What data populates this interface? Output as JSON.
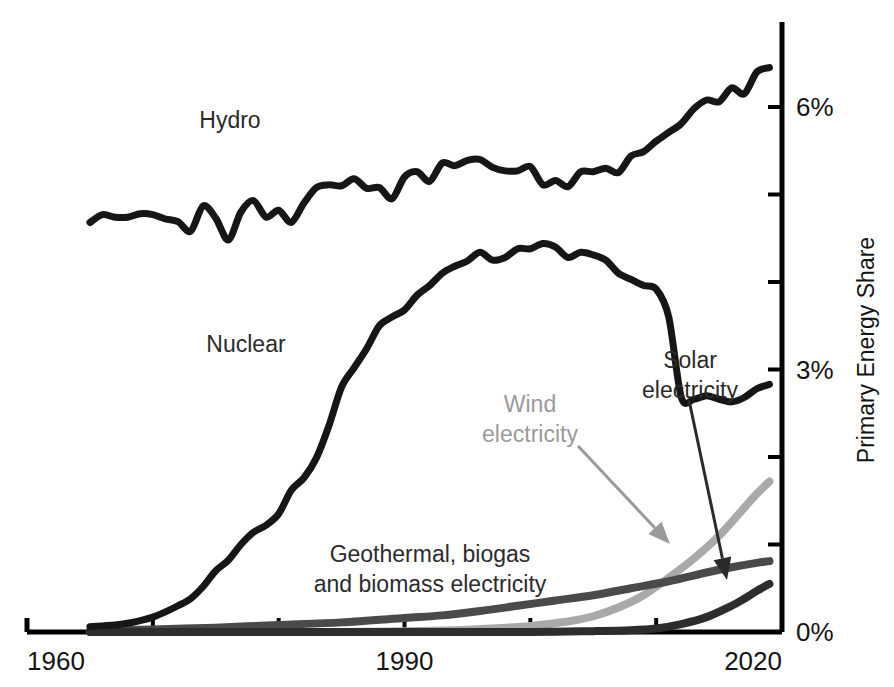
{
  "chart_data": {
    "type": "line",
    "title": "",
    "subtitle": "",
    "xlabel": "",
    "ylabel": "Primary Energy Share",
    "xlim": [
      1960,
      2020
    ],
    "ylim": [
      0,
      7
    ],
    "grid": false,
    "legend_position": "inline-annotations",
    "x_ticks": [
      {
        "value": 1960,
        "label": "1960"
      },
      {
        "value": 1970,
        "label": ""
      },
      {
        "value": 1980,
        "label": ""
      },
      {
        "value": 1990,
        "label": "1990"
      },
      {
        "value": 2000,
        "label": ""
      },
      {
        "value": 2010,
        "label": ""
      },
      {
        "value": 2020,
        "label": "2020"
      }
    ],
    "y_ticks": [
      {
        "value": 0,
        "label": "0%"
      },
      {
        "value": 1,
        "label": ""
      },
      {
        "value": 2,
        "label": ""
      },
      {
        "value": 3,
        "label": "3%"
      },
      {
        "value": 4,
        "label": ""
      },
      {
        "value": 5,
        "label": ""
      },
      {
        "value": 6,
        "label": "6%"
      }
    ],
    "colors": {
      "hydro": "#161616",
      "nuclear": "#161616",
      "wind": "#a9a9a9",
      "solar": "#2d2d2d",
      "geothermal": "#4a4a4a",
      "axis": "#000000",
      "text": "#141414",
      "wind_label": "#9a9a9a"
    },
    "series": [
      {
        "name": "Hydro",
        "color": "#161616",
        "width": 7,
        "x": [
          1965,
          1966,
          1967,
          1968,
          1969,
          1970,
          1971,
          1972,
          1973,
          1974,
          1975,
          1976,
          1977,
          1978,
          1979,
          1980,
          1981,
          1982,
          1983,
          1984,
          1985,
          1986,
          1987,
          1988,
          1989,
          1990,
          1991,
          1992,
          1993,
          1994,
          1995,
          1996,
          1997,
          1998,
          1999,
          2000,
          2001,
          2002,
          2003,
          2004,
          2005,
          2006,
          2007,
          2008,
          2009,
          2010,
          2011,
          2012,
          2013,
          2014,
          2015,
          2016,
          2017,
          2018,
          2019
        ],
        "values": [
          4.68,
          4.77,
          4.74,
          4.74,
          4.78,
          4.77,
          4.72,
          4.69,
          4.58,
          4.87,
          4.73,
          4.48,
          4.8,
          4.93,
          4.74,
          4.82,
          4.68,
          4.9,
          5.08,
          5.11,
          5.1,
          5.18,
          5.07,
          5.08,
          4.95,
          5.2,
          5.26,
          5.15,
          5.36,
          5.33,
          5.39,
          5.4,
          5.31,
          5.27,
          5.27,
          5.32,
          5.11,
          5.16,
          5.09,
          5.26,
          5.26,
          5.3,
          5.25,
          5.44,
          5.49,
          5.61,
          5.71,
          5.81,
          5.98,
          6.08,
          6.06,
          6.22,
          6.15,
          6.4,
          6.45
        ]
      },
      {
        "name": "Nuclear",
        "color": "#161616",
        "width": 7,
        "x": [
          1965,
          1966,
          1967,
          1968,
          1969,
          1970,
          1971,
          1972,
          1973,
          1974,
          1975,
          1976,
          1977,
          1978,
          1979,
          1980,
          1981,
          1982,
          1983,
          1984,
          1985,
          1986,
          1987,
          1988,
          1989,
          1990,
          1991,
          1992,
          1993,
          1994,
          1995,
          1996,
          1997,
          1998,
          1999,
          2000,
          2001,
          2002,
          2003,
          2004,
          2005,
          2006,
          2007,
          2008,
          2009,
          2010,
          2011,
          2012,
          2013,
          2014,
          2015,
          2016,
          2017,
          2018,
          2019
        ],
        "values": [
          0.06,
          0.07,
          0.08,
          0.1,
          0.13,
          0.17,
          0.23,
          0.3,
          0.38,
          0.52,
          0.7,
          0.82,
          1.0,
          1.14,
          1.22,
          1.35,
          1.62,
          1.76,
          1.99,
          2.36,
          2.8,
          3.02,
          3.24,
          3.5,
          3.6,
          3.68,
          3.85,
          3.96,
          4.1,
          4.18,
          4.24,
          4.34,
          4.25,
          4.28,
          4.38,
          4.38,
          4.44,
          4.4,
          4.28,
          4.34,
          4.31,
          4.25,
          4.1,
          4.03,
          3.96,
          3.92,
          3.6,
          2.68,
          2.66,
          2.7,
          2.66,
          2.63,
          2.68,
          2.78,
          2.83
        ]
      },
      {
        "name": "Geothermal, biogas and biomass electricity",
        "color": "#4a4a4a",
        "width": 8,
        "x": [
          1965,
          1970,
          1975,
          1980,
          1985,
          1990,
          1993,
          1996,
          1999,
          2002,
          2005,
          2008,
          2011,
          2014,
          2016,
          2018,
          2019
        ],
        "values": [
          0.01,
          0.03,
          0.05,
          0.08,
          0.11,
          0.16,
          0.19,
          0.24,
          0.3,
          0.36,
          0.42,
          0.5,
          0.58,
          0.68,
          0.74,
          0.79,
          0.81
        ]
      },
      {
        "name": "Wind electricity",
        "color": "#a9a9a9",
        "width": 8,
        "x": [
          1965,
          1980,
          1985,
          1990,
          1994,
          1997,
          2000,
          2003,
          2005,
          2007,
          2009,
          2011,
          2013,
          2015,
          2017,
          2018,
          2019
        ],
        "values": [
          0.0,
          0.0,
          0.0,
          0.01,
          0.02,
          0.04,
          0.07,
          0.12,
          0.18,
          0.28,
          0.42,
          0.62,
          0.84,
          1.1,
          1.42,
          1.58,
          1.72
        ]
      },
      {
        "name": "Solar electricity",
        "color": "#2d2d2d",
        "width": 8,
        "x": [
          1965,
          1990,
          2000,
          2005,
          2008,
          2010,
          2012,
          2014,
          2016,
          2017,
          2018,
          2019
        ],
        "values": [
          0.0,
          0.0,
          0.0,
          0.01,
          0.02,
          0.04,
          0.09,
          0.17,
          0.3,
          0.38,
          0.47,
          0.55
        ]
      }
    ],
    "annotations": [
      {
        "id": "hydro-label",
        "text": "Hydro",
        "color": "#2b2b2b",
        "x": 230,
        "y": 128,
        "anchor": "middle",
        "arrow": false
      },
      {
        "id": "nuclear-label",
        "text": "Nuclear",
        "color": "#2b2b2b",
        "x": 246,
        "y": 352,
        "anchor": "middle",
        "arrow": false
      },
      {
        "id": "geothermal-label",
        "lines": [
          "Geothermal, biogas",
          "and biomass electricity"
        ],
        "color": "#2b2b2b",
        "x": 430,
        "y": 562,
        "anchor": "middle",
        "arrow": false
      },
      {
        "id": "wind-label",
        "lines": [
          "Wind",
          "electricity"
        ],
        "color": "#9a9a9a",
        "x": 530,
        "y": 412,
        "anchor": "middle",
        "arrow": true,
        "arrow_from": [
          578,
          446
        ],
        "arrow_to": [
          670,
          544
        ]
      },
      {
        "id": "solar-label",
        "lines": [
          "Solar",
          "electricity"
        ],
        "color": "#2b2b2b",
        "x": 690,
        "y": 368,
        "anchor": "middle",
        "arrow": true,
        "arrow_from": [
          689,
          400
        ],
        "arrow_to": [
          727,
          580
        ]
      }
    ]
  },
  "axis": {
    "y_title": "Primary Energy Share",
    "x_first_label": "1960",
    "x_mid_label": "1990",
    "x_last_label": "2020",
    "y_zero_label": "0%",
    "y_mid_label": "3%",
    "y_top_label": "6%"
  }
}
